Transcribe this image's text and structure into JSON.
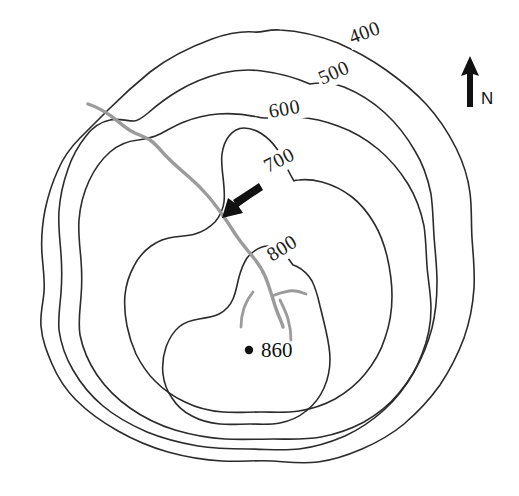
{
  "map": {
    "title": "Topographic contour map of a hill",
    "type": "contour-map",
    "background_color": "#ffffff",
    "contour_line_color": "#2b2b2b",
    "stream_color": "#9b9b9b",
    "label_color": "#1c1c1c",
    "contour_interval": 100,
    "units_implied": "meters"
  },
  "contours": [
    {
      "id": "c400",
      "elevation": 400,
      "label": "400",
      "label_x": 352,
      "label_y": 44,
      "label_rotation": -20
    },
    {
      "id": "c500",
      "elevation": 500,
      "label": "500",
      "label_x": 322,
      "label_y": 85,
      "label_rotation": -24
    },
    {
      "id": "c600",
      "elevation": 600,
      "label": "600",
      "label_x": 270,
      "label_y": 118,
      "label_rotation": -10
    },
    {
      "id": "c700",
      "elevation": 700,
      "label": "700",
      "label_x": 268,
      "label_y": 173,
      "label_rotation": -27
    },
    {
      "id": "c800",
      "elevation": 800,
      "label": "800",
      "label_x": 272,
      "label_y": 262,
      "label_rotation": -32
    }
  ],
  "summit": {
    "label": "860",
    "elevation": 860,
    "dot_x": 249,
    "dot_y": 350,
    "label_x": 261,
    "label_y": 357,
    "marker": "spot-height-dot"
  },
  "north_arrow": {
    "label": "N",
    "label_x": 487,
    "label_y": 103,
    "arrow_x": 470,
    "arrow_top_y": 57,
    "arrow_bottom_y": 106
  },
  "pointer_arrow": {
    "name": "direction-arrow",
    "description": "black arrow pointing southwest toward the stream",
    "tip_x": 224,
    "tip_y": 216,
    "tail_x": 258,
    "tail_y": 184,
    "direction": "southwest"
  },
  "stream": {
    "name": "stream-channel",
    "color": "#9b9b9b",
    "description": "gray drainage channel flowing from upper-left down to the summit area with tributaries"
  }
}
